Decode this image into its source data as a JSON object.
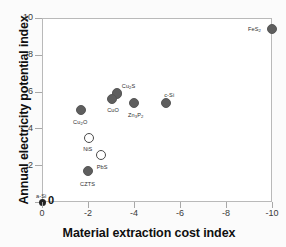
{
  "chart_data": {
    "type": "scatter",
    "title": "",
    "xlabel": "Material extraction cost index",
    "ylabel": "Annual electricity potential index",
    "xlim": [
      0,
      -10
    ],
    "ylim": [
      0,
      10
    ],
    "xticks": [
      "0",
      "-2",
      "-4",
      "-6",
      "-8",
      "-10"
    ],
    "yticks": [
      "0",
      "2",
      "4",
      "6",
      "8",
      "10"
    ],
    "grid": false,
    "legend": "none",
    "points": [
      {
        "label": "FeS2",
        "label_html": "FeS<sub>2</sub>",
        "x": -10.0,
        "y": 9.4,
        "style": "filled"
      },
      {
        "label": "c-Si",
        "label_html": "c-Si",
        "x": -5.4,
        "y": 5.4,
        "style": "filled"
      },
      {
        "label": "Zn3P2",
        "label_html": "Zn<sub>3</sub>P<sub>2</sub>",
        "x": -4.0,
        "y": 5.4,
        "style": "filled"
      },
      {
        "label": "Cu2S",
        "label_html": "Cu<sub>2</sub>S",
        "x": -3.25,
        "y": 5.9,
        "style": "filled"
      },
      {
        "label": "CuO",
        "label_html": "CuO",
        "x": -3.05,
        "y": 5.6,
        "style": "filled"
      },
      {
        "label": "Cu2O",
        "label_html": "Cu<sub>2</sub>O",
        "x": -1.7,
        "y": 5.0,
        "style": "filled"
      },
      {
        "label": "NiS",
        "label_html": "NiS",
        "x": -2.05,
        "y": 3.5,
        "style": "open"
      },
      {
        "label": "PbS",
        "label_html": "PbS",
        "x": -2.55,
        "y": 2.55,
        "style": "open"
      },
      {
        "label": "CZTS",
        "label_html": "CZTS",
        "x": -2.0,
        "y": 1.7,
        "style": "filled"
      },
      {
        "label": "a-Si",
        "label_html": "a-Si",
        "x": 0.0,
        "y": 0.0,
        "style": "origin"
      }
    ]
  },
  "axes": {
    "origin_value_label": "0"
  },
  "colors": {
    "marker_filled": "#5e5e5e",
    "marker_open_border": "#4a4a4a",
    "frame": "#b9b9b9",
    "text": "#101010",
    "background": "#ffffff"
  }
}
